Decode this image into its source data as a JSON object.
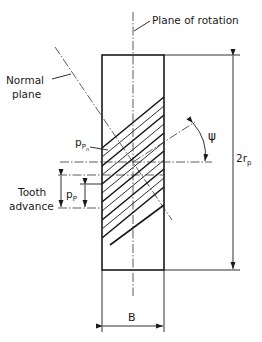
{
  "diagram": {
    "labels": {
      "plane_of_rotation": "Plane of rotation",
      "normal_plane_line1": "Normal",
      "normal_plane_line2": "plane",
      "tooth_advance_line1": "Tooth",
      "tooth_advance_line2": "advance",
      "p_pn_main": "p",
      "p_pn_sub1": "P",
      "p_pn_sub2": "n",
      "p_p_main": "p",
      "p_p_sub": "P",
      "psi": "ψ",
      "diameter_main": "2r",
      "diameter_sub": "p",
      "width": "B"
    },
    "colors": {
      "ink": "#1a1a1a",
      "background": "#ffffff"
    }
  }
}
